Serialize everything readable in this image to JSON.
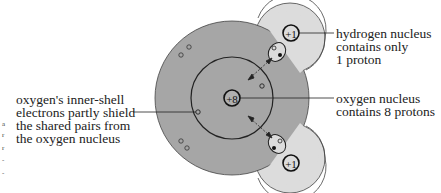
{
  "diagram": {
    "colors": {
      "oxygen_region": "#a6a6a6",
      "hydrogen_region": "#dcdcdc",
      "outline": "#222222",
      "background": "#ffffff"
    },
    "nuclei": {
      "oxygen_charge": "+8",
      "hydrogen_top_charge": "+1",
      "hydrogen_bottom_charge": "+1"
    },
    "labels": {
      "hydrogen_nucleus": [
        "hydrogen nucleus",
        "contains only",
        "1 proton"
      ],
      "oxygen_nucleus": [
        "oxygen nucleus",
        "contains 8 protons"
      ],
      "inner_shell": [
        "oxygen's inner-shell",
        "electrons partly shield",
        "the shared pairs from",
        "the oxygen nucleus"
      ]
    },
    "margin_fragments": [
      "a",
      "r",
      "r",
      "-",
      "-"
    ]
  }
}
